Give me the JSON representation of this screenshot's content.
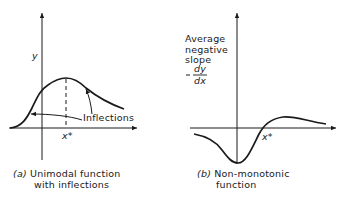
{
  "panel_a": {
    "y_label": "y",
    "x_marker": "x*",
    "annotation": "Inflections",
    "caption_tag": "(a)",
    "caption_line1": "Unimodal function",
    "caption_line2": "with inflections"
  },
  "panel_b": {
    "y_label_line1": "Average",
    "y_label_line2": "negative",
    "y_label_line3": "slope",
    "y_label_minus": "–",
    "y_label_num": "dy",
    "y_label_den": "dx",
    "x_marker": "x*",
    "caption_tag": "(b)",
    "caption_line1": "Non-monotonic",
    "caption_line2": "function"
  },
  "colors": {
    "ink": "#1a1a1a",
    "background": "#ffffff"
  }
}
